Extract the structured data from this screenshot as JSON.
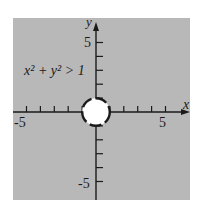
{
  "chart_data": {
    "type": "region",
    "title": "",
    "inequality": "x^2 + y^2 > 1",
    "label_text": "x² + y² > 1",
    "xlabel": "x",
    "ylabel": "y",
    "xlim": [
      -5.8,
      6.6
    ],
    "ylim": [
      -6.6,
      6.6
    ],
    "x_ticks": [
      -5,
      -4,
      -3,
      -2,
      -1,
      1,
      2,
      3,
      4,
      5
    ],
    "y_ticks": [
      -5,
      -4,
      -3,
      -2,
      -1,
      1,
      2,
      3,
      4,
      5
    ],
    "x_tick_labels": [
      "-5",
      "5"
    ],
    "y_tick_labels": [
      "5",
      "-5"
    ],
    "boundary": {
      "shape": "circle",
      "center": [
        0,
        0
      ],
      "radius": 1,
      "style": "dashed"
    },
    "shaded_region": "outside circle",
    "grid": false
  },
  "colors": {
    "shade": "#b8b8b8",
    "interior": "#ffffff",
    "axis": "#1a1a1a"
  }
}
